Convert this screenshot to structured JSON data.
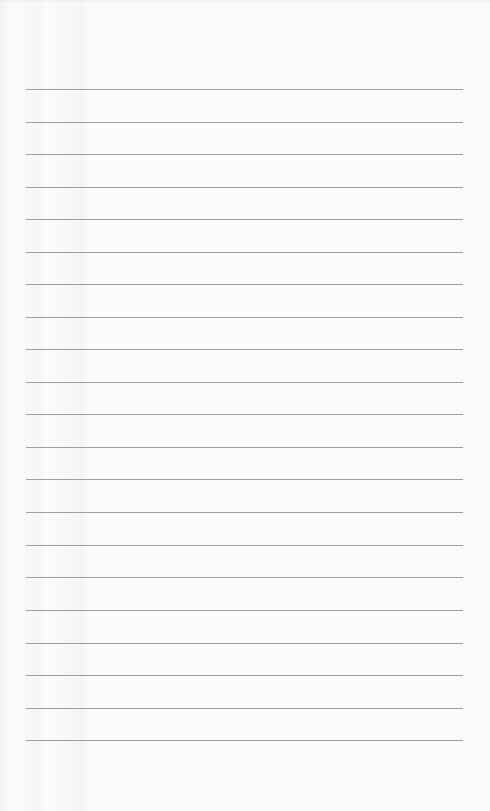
{
  "page": {
    "type": "blank-lined-paper",
    "background_color": "#fbfbfa",
    "rule_color": "#8e8e8e",
    "rule_count": 21,
    "rules_y": [
      89,
      122,
      154,
      187,
      219,
      252,
      284,
      317,
      349,
      382,
      414,
      447,
      479,
      512,
      545,
      577,
      610,
      643,
      675,
      708,
      740
    ],
    "rule_left": 26,
    "rule_right": 463
  }
}
